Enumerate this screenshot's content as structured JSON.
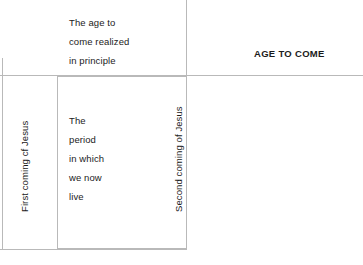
{
  "diagram": {
    "title_label": "AGE TO COME",
    "axis_labels": {
      "left_vertical": "First coming cf Jesus",
      "middle_vertical": "Second coming of Jesus"
    },
    "blocks": {
      "age_realized": "The age to\ncome realized\nin principle",
      "present_period": "The\nperiod\nin which\nwe now\nlive"
    },
    "colors": {
      "line": "#b9b9b9",
      "text": "#1b1b1b",
      "background": "#ffffff"
    }
  }
}
